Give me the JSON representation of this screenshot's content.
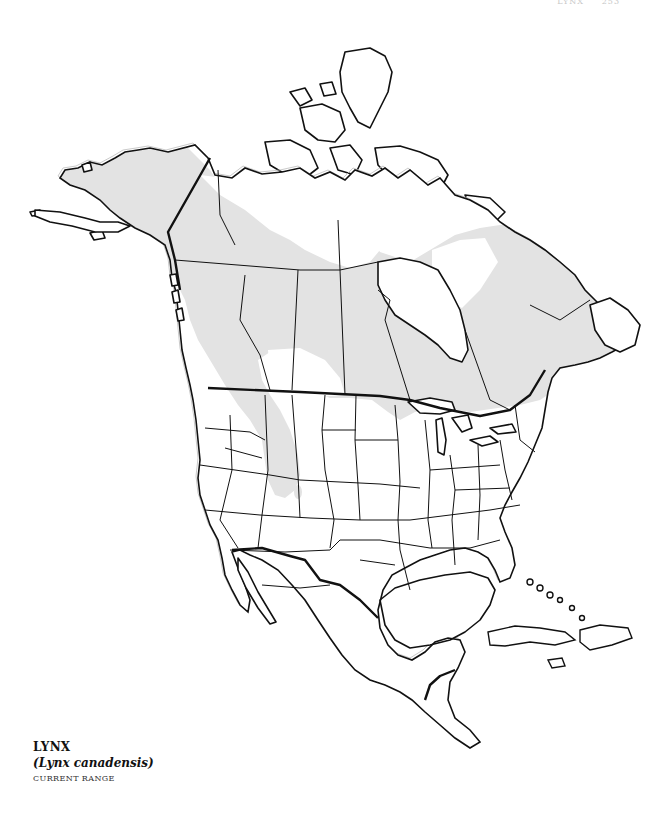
{
  "page_header": {
    "running_head": "LYNX",
    "page_number": "253"
  },
  "map": {
    "region": "North America",
    "range_fill_color": "#e3e3e3",
    "land_color": "#ffffff",
    "outline_color": "#111111",
    "shaded_regions": [
      "Alaska",
      "Yukon",
      "Northwest Territories (southern)",
      "British Columbia",
      "Alberta",
      "Saskatchewan (northern)",
      "Manitoba",
      "Ontario",
      "Quebec",
      "Labrador",
      "Newfoundland",
      "Maine",
      "Northern Great Lakes states",
      "Northern Rocky Mountains",
      "Colorado (isolated patch)"
    ]
  },
  "legend": {
    "common_name": "LYNX",
    "scientific_name": "(Lynx canadensis)",
    "caption": "CURRENT RANGE"
  }
}
